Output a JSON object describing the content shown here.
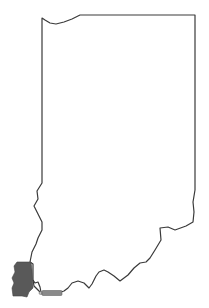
{
  "map": {
    "region": "Indiana",
    "highlighted_county": "Posey County",
    "colors": {
      "background": "#ffffff",
      "outline": "#3a3a3a",
      "highlight_fill": "#595959"
    },
    "label": {
      "text": "",
      "note": "small unreadable label near southern border"
    }
  }
}
